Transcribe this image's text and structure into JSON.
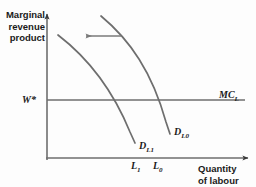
{
  "figure": {
    "background_color": "#fdfdfd",
    "axis_color": "#6e6e6e",
    "curve_color": "#6e6e6e",
    "text_color": "#1a1a1a"
  },
  "axes": {
    "y_label": "Marginal\nrevenue\nproduct",
    "x_label": "Quantity\nof labour",
    "origin_x": 47,
    "origin_y": 158,
    "x_axis_end": 250,
    "y_axis_top": 12
  },
  "lines": {
    "wage_line_label": "W*",
    "wage_line_y": 100,
    "mc_label": "MC",
    "mc_label_sub": "L"
  },
  "curves": [
    {
      "name": "demand-curve-initial",
      "label": "D",
      "label_sub": "L0",
      "path": "M 101 16 C 130 40, 152 72, 166 122 L 170 134",
      "x_intercept": 158
    },
    {
      "name": "demand-curve-shifted",
      "label": "D",
      "label_sub": "L1",
      "path": "M 58 35 C 88 58, 112 88, 130 132 L 135 143",
      "x_intercept": 137
    }
  ],
  "shift_arrow": {
    "name": "leftward-shift-arrow",
    "direction": "left",
    "from_x": 121,
    "to_x": 84,
    "y": 36
  },
  "ticks": [
    {
      "name": "tick-l1",
      "label": "L",
      "label_sub": "1",
      "x": 137
    },
    {
      "name": "tick-l0",
      "label": "L",
      "label_sub": "0",
      "x": 158
    }
  ]
}
